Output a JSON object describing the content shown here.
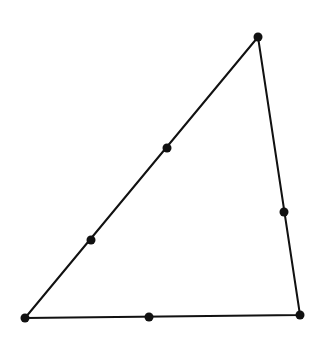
{
  "diagram": {
    "type": "triangle-with-points",
    "stroke_color": "#111111",
    "background": "#ffffff",
    "vertices": [
      {
        "id": "top",
        "x": 258,
        "y": 37
      },
      {
        "id": "bottom-left",
        "x": 25,
        "y": 318
      },
      {
        "id": "bottom-right",
        "x": 300,
        "y": 315
      }
    ],
    "edge_points": [
      {
        "id": "left-edge-upper",
        "x": 167,
        "y": 148
      },
      {
        "id": "left-edge-lower",
        "x": 91,
        "y": 240
      },
      {
        "id": "right-edge",
        "x": 284,
        "y": 212
      },
      {
        "id": "bottom-edge",
        "x": 149,
        "y": 317
      }
    ]
  }
}
